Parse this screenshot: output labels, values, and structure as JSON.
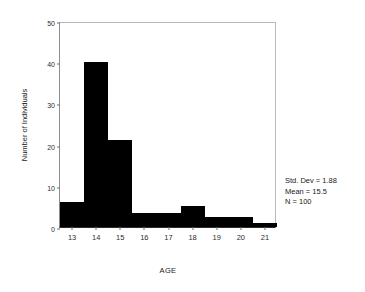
{
  "chart_data": {
    "type": "bar",
    "title": "",
    "subtitle": "",
    "xlabel": "AGE",
    "ylabel": "Number of Individuals",
    "categories": [
      "13",
      "14",
      "15",
      "16",
      "17",
      "18",
      "19",
      "20",
      "21"
    ],
    "bin_edges": [
      12.5,
      13.5,
      14.5,
      15.5,
      16.5,
      17.5,
      18.5,
      19.5,
      20.5,
      21.5
    ],
    "values": [
      6,
      40,
      21,
      3.5,
      3.5,
      5,
      2.5,
      2.5,
      1
    ],
    "bin_width": 1,
    "xlim": [
      12.5,
      21.5
    ],
    "ylim": [
      0,
      50
    ],
    "xticks": [
      "13",
      "14",
      "15",
      "16",
      "17",
      "18",
      "19",
      "20",
      "21"
    ],
    "yticks": [
      "0",
      "10",
      "20",
      "30",
      "40",
      "50"
    ],
    "ytick_values": [
      0,
      10,
      20,
      30,
      40,
      50
    ],
    "grid": false,
    "legend": "none",
    "bar_color": "#000000",
    "frame_color": "#b9b9b9",
    "axis_color": "#2b2b2b"
  },
  "annotations": {
    "std_dev": "Std. Dev = 1.88",
    "mean": "Mean = 15.5",
    "n": "N = 100"
  }
}
